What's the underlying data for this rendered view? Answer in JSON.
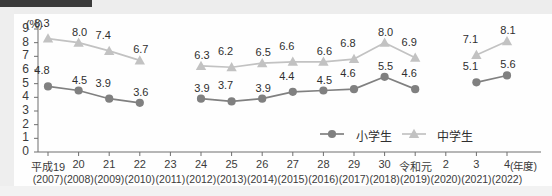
{
  "chart_data": {
    "type": "line",
    "title": "",
    "xlabel": "(年度)",
    "ylabel": "(%)",
    "ylim": [
      0,
      9
    ],
    "yticks": [
      0,
      1,
      2,
      3,
      4,
      5,
      6,
      7,
      8,
      9
    ],
    "grid": false,
    "legend_position": "bottom-right",
    "categories": [
      "平成19",
      "20",
      "21",
      "22",
      "23",
      "24",
      "25",
      "26",
      "27",
      "28",
      "29",
      "30",
      "令和元",
      "2",
      "3",
      "4"
    ],
    "categories_sub": [
      "(2007)",
      "(2008)",
      "(2009)",
      "(2010)",
      "(2011)",
      "(2012)",
      "(2013)",
      "(2014)",
      "(2015)",
      "(2016)",
      "(2017)",
      "(2018)",
      "(2019)",
      "(2020)",
      "(2021)",
      "(2022)"
    ],
    "series": [
      {
        "name": "小学生",
        "marker": "circle",
        "color": "#808080",
        "values": [
          4.8,
          4.5,
          3.9,
          3.6,
          null,
          3.9,
          3.7,
          3.9,
          4.4,
          4.5,
          4.6,
          5.5,
          4.6,
          null,
          5.1,
          5.6
        ]
      },
      {
        "name": "中学生",
        "marker": "triangle",
        "color": "#c2c2c2",
        "values": [
          8.3,
          8.0,
          7.4,
          6.7,
          null,
          6.3,
          6.2,
          6.5,
          6.6,
          6.6,
          6.8,
          8.0,
          6.9,
          null,
          7.1,
          8.1
        ]
      }
    ]
  },
  "legend": {
    "items": [
      {
        "label": "小学生",
        "marker": "circle",
        "color": "#808080"
      },
      {
        "label": "中学生",
        "marker": "triangle",
        "color": "#c2c2c2"
      }
    ]
  },
  "axis": {
    "unit_y": "(%)",
    "unit_x": "(年度)"
  }
}
